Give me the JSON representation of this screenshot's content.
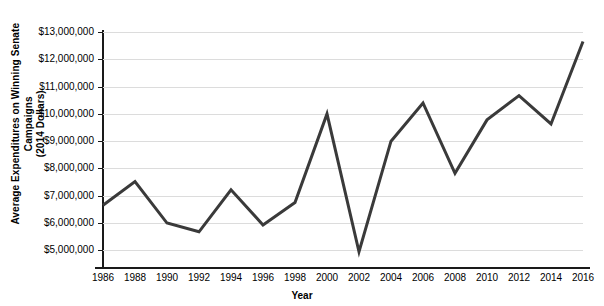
{
  "chart_data": {
    "type": "line",
    "title": "",
    "xlabel": "Year",
    "ylabel": "Average Expenditures on Winning Senate Campaigns (2014 Dollars)",
    "ylabel_line1": "Average Expenditures on Winning Senate Campaigns",
    "ylabel_line2": "(2014 Dollars)",
    "categories": [
      1986,
      1988,
      1990,
      1992,
      1994,
      1996,
      1998,
      2000,
      2002,
      2004,
      2006,
      2008,
      2010,
      2012,
      2014,
      2016
    ],
    "x_tick_labels": [
      "1986",
      "1988",
      "1990",
      "1992",
      "1994",
      "1996",
      "1998",
      "2000",
      "2002",
      "2004",
      "2006",
      "2008",
      "2010",
      "2012",
      "2014",
      "2016"
    ],
    "values": [
      6650000,
      7520000,
      6000000,
      5680000,
      7220000,
      5930000,
      6750000,
      10000000,
      4950000,
      9000000,
      10400000,
      7820000,
      9780000,
      10670000,
      9630000,
      12650000
    ],
    "y_ticks": [
      5000000,
      6000000,
      7000000,
      8000000,
      9000000,
      10000000,
      11000000,
      12000000,
      13000000
    ],
    "y_tick_labels": [
      "$5,000,000",
      "$6,000,000",
      "$7,000,000",
      "$8,000,000",
      "$9,000,000",
      "$10,000,000",
      "$11,000,000",
      "$12,000,000",
      "$13,000,000"
    ],
    "ylim": [
      4720000,
      13000000
    ],
    "xlim": [
      1986,
      2016
    ],
    "grid": true,
    "legend": false,
    "line_color": "#3a3a3a",
    "line_width": 3,
    "grid_color": "#dcdcdc",
    "axis_color": "#1a1a1a",
    "background_color": "#ffffff"
  }
}
